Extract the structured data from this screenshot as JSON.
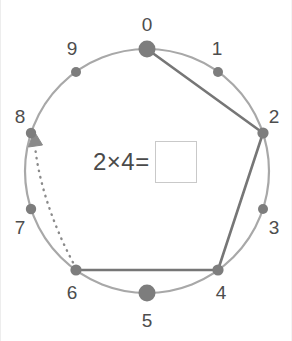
{
  "figure": {
    "type": "number-circle",
    "title": "",
    "colors": {
      "circle_stroke": "#a8a8a8",
      "chord_stroke": "#767676",
      "dot_fill": "#7d7d7d",
      "landmark_dot_fill": "#7d7d7d",
      "label_text": "#4d4d4d",
      "equation_text": "#4a4a4a",
      "answer_box_border": "#c9c9c9",
      "background": "#ffffff"
    },
    "circle": {
      "cx": 146,
      "cy": 171,
      "r": 122,
      "stroke_width": 2.2
    },
    "node_count": 10,
    "nodes": [
      {
        "id": "0",
        "label": "0",
        "angle_deg": -90,
        "x": 146,
        "y": 49,
        "dot_r": 8.5,
        "landmark": true,
        "label_x": 146,
        "label_y": 24
      },
      {
        "id": "1",
        "label": "1",
        "angle_deg": -54,
        "x": 217,
        "y": 72,
        "dot_r": 5.0,
        "landmark": false,
        "label_x": 216,
        "label_y": 48
      },
      {
        "id": "2",
        "label": "2",
        "angle_deg": -18,
        "x": 262,
        "y": 133,
        "dot_r": 5.6,
        "landmark": false,
        "label_x": 273,
        "label_y": 116
      },
      {
        "id": "3",
        "label": "3",
        "angle_deg": 18,
        "x": 262,
        "y": 209,
        "dot_r": 5.0,
        "landmark": false,
        "label_x": 273,
        "label_y": 227
      },
      {
        "id": "4",
        "label": "4",
        "angle_deg": 54,
        "x": 217,
        "y": 270,
        "dot_r": 5.6,
        "landmark": false,
        "label_x": 220,
        "label_y": 292
      },
      {
        "id": "5",
        "label": "5",
        "angle_deg": 90,
        "x": 146,
        "y": 293,
        "dot_r": 8.5,
        "landmark": true,
        "label_x": 146,
        "label_y": 320
      },
      {
        "id": "6",
        "label": "6",
        "angle_deg": 126,
        "x": 75,
        "y": 270,
        "dot_r": 5.6,
        "landmark": false,
        "label_x": 71,
        "label_y": 292
      },
      {
        "id": "7",
        "label": "7",
        "angle_deg": 162,
        "x": 30,
        "y": 209,
        "dot_r": 5.2,
        "landmark": false,
        "label_x": 19,
        "label_y": 227
      },
      {
        "id": "8",
        "label": "8",
        "angle_deg": 198,
        "x": 30,
        "y": 133,
        "dot_r": 5.2,
        "landmark": false,
        "label_x": 19,
        "label_y": 116
      },
      {
        "id": "9",
        "label": "9",
        "angle_deg": 234,
        "x": 75,
        "y": 72,
        "dot_r": 5.0,
        "landmark": false,
        "label_x": 71,
        "label_y": 48
      }
    ],
    "chords": [
      {
        "from": "0",
        "to": "2"
      },
      {
        "from": "2",
        "to": "4"
      },
      {
        "from": "4",
        "to": "6"
      }
    ],
    "chord_stroke_width": 2.6,
    "jump_arrow": {
      "from": "6",
      "to": "8",
      "style": "dotted",
      "has_arrowhead": true,
      "stroke_width": 2.4,
      "dash": "0.5 6"
    }
  },
  "equation": {
    "expression": "2×4=",
    "factor_a": "2",
    "operator": "×",
    "factor_b": "4",
    "equals": "=",
    "answer_value": "",
    "answer_placeholder": ""
  }
}
